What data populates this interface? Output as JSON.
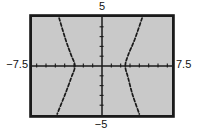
{
  "chart_data": {
    "type": "line",
    "title": "",
    "subtitle": "",
    "window": {
      "xmin": -7.5,
      "xmax": 7.5,
      "xscl": 1,
      "ymin": -5,
      "ymax": 5,
      "yscl": 1
    },
    "axis_edge_labels": {
      "top": "5",
      "bottom": "−5",
      "left": "−7.5",
      "right": "7.5"
    },
    "grid": false,
    "legend": false,
    "curve_style": "dashed",
    "series": [
      {
        "name": "hyperbola-left-branch",
        "points": [
          [
            -4.6,
            4.9
          ],
          [
            -3.9,
            2.7
          ],
          [
            -3.3,
            1.1
          ],
          [
            -2.9,
            0
          ],
          [
            -3.3,
            -1.2
          ],
          [
            -4.0,
            -3.0
          ],
          [
            -4.8,
            -4.9
          ]
        ]
      },
      {
        "name": "hyperbola-right-branch",
        "points": [
          [
            4.3,
            4.9
          ],
          [
            3.5,
            2.7
          ],
          [
            2.8,
            1.1
          ],
          [
            2.5,
            0
          ],
          [
            2.8,
            -1.2
          ],
          [
            3.3,
            -3.0
          ],
          [
            4.0,
            -4.9
          ]
        ]
      }
    ],
    "colors": {
      "ink": "#1a1a1a",
      "screen_fill": "#c9c9c9",
      "page_background": "#ffffff"
    }
  }
}
